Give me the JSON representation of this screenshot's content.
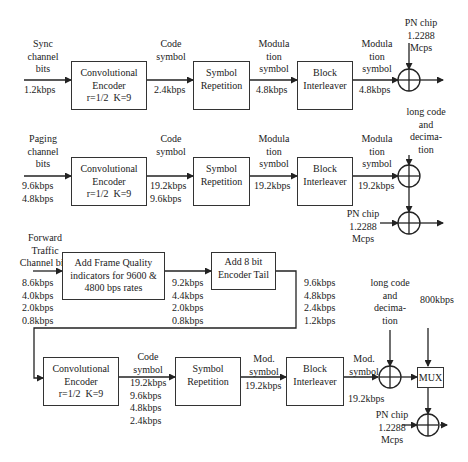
{
  "sync": {
    "input_label": "Sync\nchannel\nbits",
    "input_rate": "1.2kbps",
    "encoder": "Convolutional\nEncoder\nr=1/2  K=9",
    "code_symbol_label": "Code\nsymbol",
    "code_rate": "2.4kbps",
    "repetition": "Symbol\nRepetition",
    "mod_label_1": "Modula\ntion\nsymbol",
    "mod_rate_1": "4.8kbps",
    "interleaver": "Block\nInterleaver",
    "mod_label_2": "Modula\ntion\nsymbol",
    "mod_rate_2": "4.8kbps",
    "pn_chip": "PN chip\n1.2288\nMcps"
  },
  "paging": {
    "long_code": "long code\nand\ndecima-\ntion",
    "input_label": "Paging\nchannel\nbits",
    "input_rate": "9.6kbps\n4.8kbps",
    "encoder": "Convolutional\nEncoder\nr=1/2  K=9",
    "code_symbol_label": "Code\nsymbol",
    "code_rate": "19.2kbps\n9.6kbps",
    "repetition": "Symbol\nRepetition",
    "mod_label_1": "Modula\ntion\nsymbol",
    "mod_rate_1": "19.2kbps",
    "interleaver": "Block\nInterleaver",
    "mod_label_2": "Modula\ntion\nsymbol",
    "mod_rate_2": "19.2kbps",
    "pn_chip": "PN chip\n1.2288\nMcps"
  },
  "traffic": {
    "input_label": "Forward\nTraffic\nChannel bits",
    "input_rate": "8.6kbps\n4.0kbps\n2.0kbps\n0.8kbps",
    "frame_quality": "Add Frame Quality\nindicators for 9600 &\n4800 bps rates",
    "fq_rate": "9.2kbps\n4.4kbps\n2.0kbps\n0.8kbps",
    "encoder_tail": "Add 8 bit\nEncoder Tail",
    "tail_rate": "9.6kbps\n4.8kbps\n2.4kbps\n1.2kbps",
    "long_code": "long code\nand\ndecima-\ntion",
    "power_control_rate": "800kbps",
    "encoder": "Convolutional\nEncoder\nr=1/2  K=9",
    "code_symbol_label": "Code\nsymbol",
    "code_rate": "19.2kbps\n9.6kbps\n4.8kbps\n2.4kbps",
    "repetition": "Symbol\nRepetition",
    "mod_label_1": "Mod.\nsymbol",
    "mod_rate_1": "19.2kbps",
    "interleaver": "Block\nInterleaver",
    "mod_label_2": "Mod.\nsymbol",
    "mod_rate_2": "19.2kbps",
    "mux": "MUX",
    "pn_chip": "PN chip\n1.2288\nMcps"
  }
}
